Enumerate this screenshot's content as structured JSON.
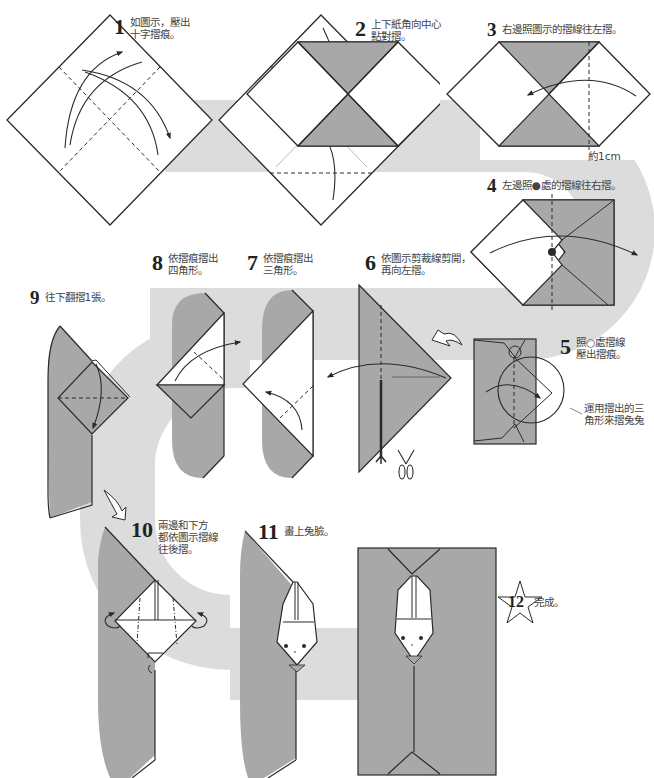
{
  "colors": {
    "paper_gray": "#a8a8a8",
    "path_gray": "#dcdcdc",
    "line": "#2a2a2a",
    "text": "#444444"
  },
  "steps": [
    {
      "num": "1",
      "lines": [
        "如圖示，壓出",
        "十字摺痕。"
      ]
    },
    {
      "num": "2",
      "lines": [
        "上下紙角向中心",
        "點對摺。"
      ]
    },
    {
      "num": "3",
      "lines": [
        "右邊照圖示的摺線往左摺。"
      ]
    },
    {
      "num": "4",
      "lines": [
        "左邊照●處的摺線往右摺。"
      ]
    },
    {
      "num": "5",
      "lines": [
        "照○處摺線",
        "壓出摺痕。"
      ]
    },
    {
      "num": "6",
      "lines": [
        "依圖示剪裁線剪開，",
        "再向左摺。"
      ]
    },
    {
      "num": "7",
      "lines": [
        "依摺痕摺出",
        "三角形。"
      ]
    },
    {
      "num": "8",
      "lines": [
        "依摺痕摺出",
        "四角形。"
      ]
    },
    {
      "num": "9",
      "lines": [
        "往下翻摺1張。"
      ]
    },
    {
      "num": "10",
      "lines": [
        "兩邊和下方",
        "都依圖示摺線",
        "往後摺。"
      ]
    },
    {
      "num": "11",
      "lines": [
        "畫上兔臉。"
      ]
    },
    {
      "num": "12",
      "lines": [
        "完成。"
      ]
    }
  ],
  "notes": {
    "step3_measure": "約1cm",
    "step5_hint": [
      "運用摺出的三",
      "角形來摺兔兔"
    ]
  },
  "icons": [
    "fold-arrow-icon",
    "scissors-icon",
    "turn-over-arrow-icon",
    "star-icon",
    "mountain-fold-arrow-icon"
  ]
}
